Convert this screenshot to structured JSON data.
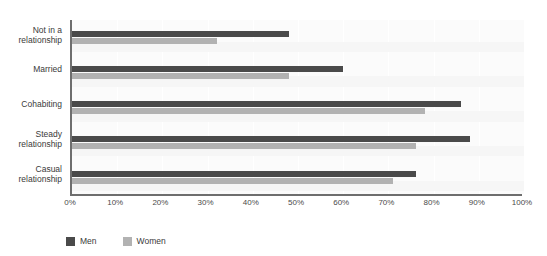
{
  "chart_data": {
    "type": "bar",
    "orientation": "horizontal",
    "title": "",
    "xlabel": "",
    "ylabel": "",
    "xlim": [
      0,
      100
    ],
    "grid": true,
    "legend_position": "bottom-left",
    "tick_labels": [
      "0%",
      "10%",
      "20%",
      "30%",
      "40%",
      "50%",
      "60%",
      "70%",
      "80%",
      "90%",
      "100%"
    ],
    "tick_values": [
      0,
      10,
      20,
      30,
      40,
      50,
      60,
      70,
      80,
      90,
      100
    ],
    "categories": [
      "Not in a relationship",
      "Married",
      "Cohabiting",
      "Steady relationship",
      "Casual relationship"
    ],
    "series": [
      {
        "name": "Men",
        "color": "#4a4a4a",
        "values": [
          48,
          60,
          86,
          88,
          76
        ]
      },
      {
        "name": "Women",
        "color": "#b2b2b2",
        "values": [
          32,
          48,
          78,
          76,
          71
        ]
      }
    ]
  },
  "chart": {
    "title_clipped": "",
    "axis_color": "#6e6e6e",
    "plot_background": "#fbfbfb",
    "gridline_color": "#ffffff"
  },
  "legend": {
    "items": [
      {
        "label": "Men",
        "color": "#4a4a4a"
      },
      {
        "label": "Women",
        "color": "#b2b2b2"
      }
    ]
  }
}
